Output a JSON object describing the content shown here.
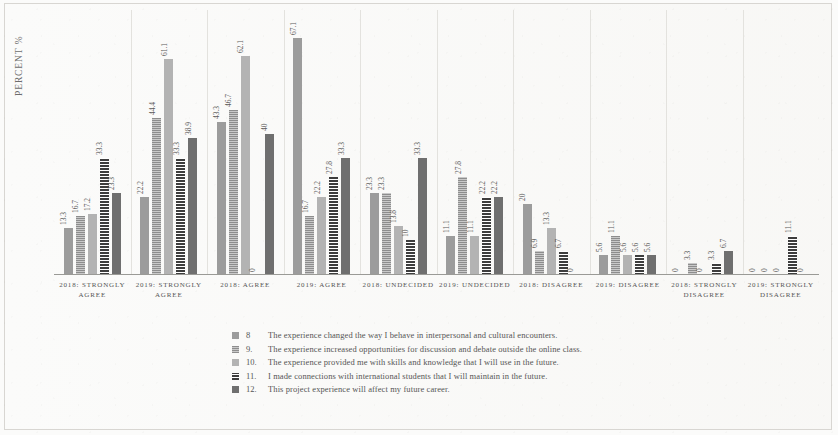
{
  "chart_data": {
    "type": "bar",
    "title": "",
    "xlabel": "",
    "ylabel": "PERCENT %",
    "ylim": [
      0,
      70
    ],
    "grid": true,
    "legend_position": "bottom",
    "categories": [
      "2018: STRONGLY AGREE",
      "2019: STRONGLY AGREE",
      "2018: AGREE",
      "2019: AGREE",
      "2018: UNDECIDED",
      "2019: UNDECIDED",
      "2018: DISAGREE",
      "2019: DISAGREE",
      "2018: STRONGLY DISAGREE",
      "2019: STRONGLY DISAGREE"
    ],
    "series": [
      {
        "name": "8",
        "label": "The experience changed the way I behave in interpersonal and cultural encounters.",
        "color": "#9c9c9c",
        "values": [
          13.3,
          22.2,
          43.3,
          67.1,
          23.3,
          11.1,
          20,
          5.6,
          0,
          0
        ]
      },
      {
        "name": "9.",
        "label": "The experience increased opportunities for discussion and debate outside the online class.",
        "color": "#8d8d8d",
        "values": [
          16.7,
          44.4,
          46.7,
          16.7,
          23.3,
          27.8,
          6.9,
          11.1,
          3.3,
          0
        ]
      },
      {
        "name": "10.",
        "label": "The experience provided me with skills and knowledge that I will use in the future.",
        "color": "#b3b3b3",
        "values": [
          17.2,
          61.1,
          62.1,
          22.2,
          13.8,
          11.1,
          13.3,
          5.6,
          0,
          0
        ]
      },
      {
        "name": "11.",
        "label": "I made connections with international students that I will maintain in the future.",
        "color": "#3d3d3d",
        "values": [
          33.3,
          33.3,
          0,
          27.8,
          10,
          22.2,
          6.7,
          5.6,
          3.3,
          11.1
        ]
      },
      {
        "name": "12.",
        "label": "This project experience will affect my future career.",
        "color": "#6f6f6f",
        "values": [
          23.3,
          38.9,
          40,
          33.3,
          33.3,
          22.2,
          0,
          5.6,
          6.7,
          0
        ]
      }
    ]
  }
}
